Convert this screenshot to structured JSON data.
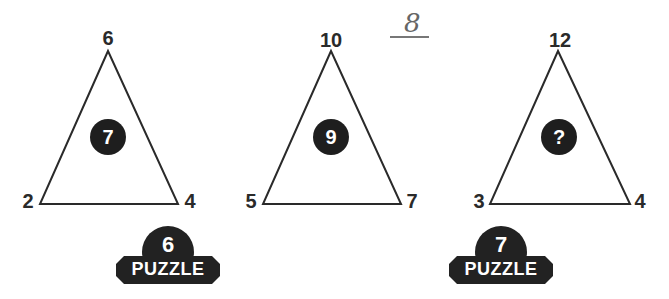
{
  "puzzles": [
    {
      "top": "6",
      "left": "2",
      "right": "4",
      "center": "7"
    },
    {
      "top": "10",
      "left": "5",
      "right": "7",
      "center": "9"
    },
    {
      "top": "12",
      "left": "3",
      "right": "4",
      "center": "?"
    }
  ],
  "handwritten_answer": "8",
  "badges": [
    {
      "number": "6",
      "label": "PUZZLE"
    },
    {
      "number": "7",
      "label": "PUZZLE"
    }
  ],
  "colors": {
    "ink": "#1e1e1e",
    "background": "#ffffff"
  }
}
